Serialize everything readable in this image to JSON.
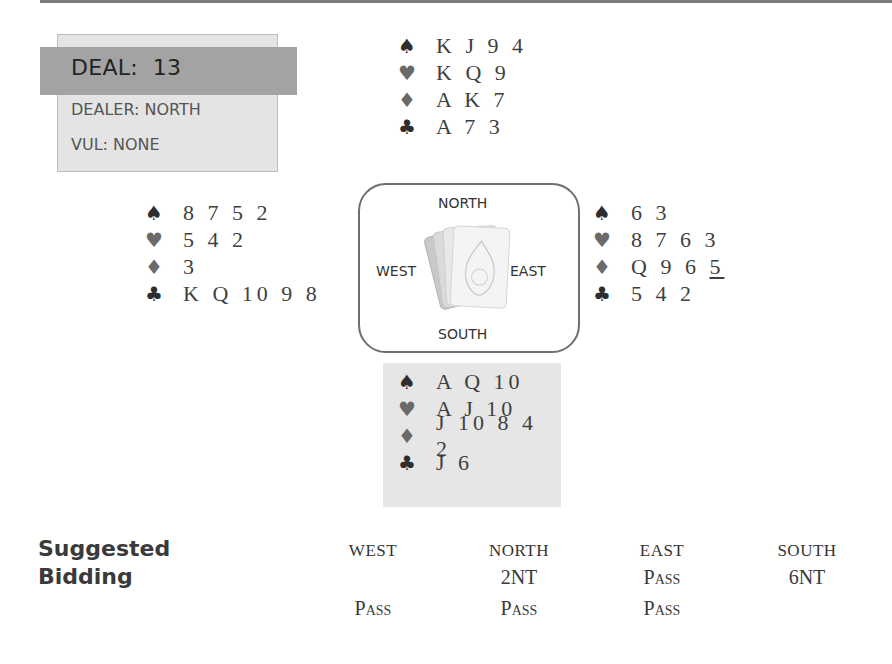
{
  "deal": {
    "title": "DEAL:  13",
    "dealer": "DEALER: NORTH",
    "vulnerability": "VUL: NONE"
  },
  "hands": {
    "north": {
      "spades": "K J 9 4",
      "hearts": "K Q 9",
      "diamonds": "A K 7",
      "clubs": "A 7 3"
    },
    "west": {
      "spades": "8 7 5 2",
      "hearts": "5 4 2",
      "diamonds": "3",
      "clubs": "K Q 10 9 8"
    },
    "east": {
      "spades": "6 3",
      "hearts": "8 7 6 3",
      "diamonds_main": "Q 9 6",
      "diamonds_lead": "5",
      "clubs": "5 4 2"
    },
    "south": {
      "spades": "A Q 10",
      "hearts": "A J 10",
      "diamonds": "J 10 8 4 2",
      "clubs": "J 6"
    }
  },
  "suits": {
    "spade": "♠",
    "heart": "♥",
    "diamond": "♦",
    "club": "♣"
  },
  "compass": {
    "north": "NORTH",
    "south": "SOUTH",
    "east": "EAST",
    "west": "WEST"
  },
  "bidding": {
    "title_line1": "Suggested",
    "title_line2": "Bidding",
    "headers": [
      "WEST",
      "NORTH",
      "EAST",
      "SOUTH"
    ],
    "rows": [
      [
        "",
        "2NT",
        "Pass",
        "6NT"
      ],
      [
        "Pass",
        "Pass",
        "Pass",
        ""
      ]
    ]
  }
}
